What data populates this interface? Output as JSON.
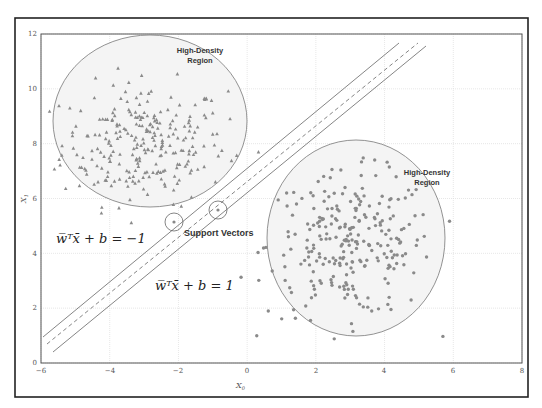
{
  "chart_data": {
    "type": "scatter",
    "title": "",
    "xlabel": "X0",
    "ylabel": "X1",
    "xlim": [
      -6,
      8
    ],
    "ylim": [
      0,
      12
    ],
    "grid": true,
    "x_ticks": [
      "-6",
      "-4",
      "-2",
      "0",
      "2",
      "4",
      "6",
      "8"
    ],
    "y_ticks": [
      "0",
      "2",
      "4",
      "6",
      "8",
      "10",
      "12"
    ],
    "series": [
      {
        "name": "class -1",
        "marker": "triangle",
        "color": "#8a8a8a",
        "center": [
          -3.0,
          8.0
        ],
        "spread": [
          1.2,
          1.1
        ],
        "count": 260
      },
      {
        "name": "class +1",
        "marker": "circle",
        "color": "#8a8a8a",
        "center": [
          3.0,
          4.3
        ],
        "spread": [
          1.2,
          1.3
        ],
        "count": 260
      }
    ],
    "regions": [
      {
        "name": "High-Density Region",
        "center": [
          -3.0,
          8.0
        ],
        "rx": 2.8,
        "ry": 3.2
      },
      {
        "name": "High-Density Region",
        "center": [
          3.2,
          4.6
        ],
        "rx": 2.6,
        "ry": 3.6
      }
    ],
    "decision_lines": [
      {
        "name": "margin -1",
        "style": "solid",
        "from": [
          -5.95,
          0.95
        ],
        "to": [
          4.4,
          11.7
        ]
      },
      {
        "name": "hyperplane",
        "style": "dashed",
        "from": [
          -5.85,
          0.7
        ],
        "to": [
          4.95,
          11.7
        ]
      },
      {
        "name": "margin +1",
        "style": "solid",
        "from": [
          -5.6,
          0.4
        ],
        "to": [
          5.2,
          11.6
        ]
      }
    ],
    "support_vectors": [
      [
        -2.1,
        5.0
      ],
      [
        -0.85,
        5.5
      ]
    ],
    "annotations": [
      {
        "text_line1": "High-Density",
        "text_line2": "Region"
      },
      {
        "text_line1": "High-Density",
        "text_line2": "Region"
      },
      {
        "text": "Support Vectors"
      },
      {
        "text": "w̅ᵀx̄ + b = −1"
      },
      {
        "text": "w̅ᵀx̄ + b = 1"
      }
    ]
  },
  "labels": {
    "xlabel_main": "X",
    "xlabel_sub": "0",
    "ylabel_main": "X",
    "ylabel_sub": "1",
    "region_top_l1": "High-Density",
    "region_top_l2": "Region",
    "region_right_l1": "High-Density",
    "region_right_l2": "Region",
    "support_vectors": "Support Vectors",
    "eq_neg": "w̅ᵀx̄ + b = −1",
    "eq_pos": "w̅ᵀx̄ + b = 1",
    "xt0": "−6",
    "xt1": "−4",
    "xt2": "−2",
    "xt3": "0",
    "xt4": "2",
    "xt5": "4",
    "xt6": "6",
    "xt7": "8",
    "yt0": "0",
    "yt1": "2",
    "yt2": "4",
    "yt3": "6",
    "yt4": "8",
    "yt5": "10",
    "yt6": "12"
  }
}
